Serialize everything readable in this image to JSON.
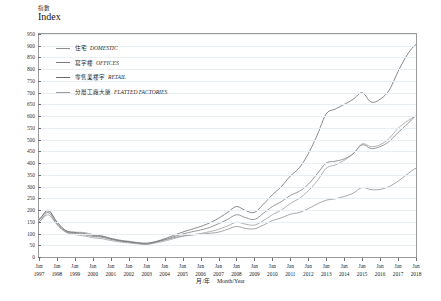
{
  "axes": {
    "y_title_cn": "指數",
    "y_title_en": "Index",
    "x_label_cn": "月/年",
    "x_label_en": "Month/Year",
    "y_ticks": [
      0,
      50,
      100,
      150,
      200,
      250,
      300,
      350,
      400,
      450,
      500,
      550,
      600,
      650,
      700,
      750,
      800,
      850,
      900,
      950
    ],
    "x_tick_month": "Jan",
    "x_tick_years": [
      1997,
      1998,
      1999,
      2000,
      2001,
      2002,
      2003,
      2004,
      2005,
      2006,
      2007,
      2008,
      2009,
      2010,
      2011,
      2012,
      2013,
      2014,
      2015,
      2016,
      2017,
      2018
    ]
  },
  "legend": [
    {
      "cn": "住宅",
      "en": "DOMESTIC",
      "color": "#8d8d8d"
    },
    {
      "cn": "寫字樓",
      "en": "OFFICES",
      "color": "#7a7a7a"
    },
    {
      "cn": "零售業樓宇",
      "en": "RETAIL",
      "color": "#6a6a6a"
    },
    {
      "cn": "分層工廠大廈",
      "en": "FLATTED FACTORIES",
      "color": "#9b9b9b"
    }
  ],
  "chart_data": {
    "type": "line",
    "title": "",
    "xlabel": "月/年 Month/Year",
    "ylabel": "指數 Index",
    "ylim": [
      0,
      950
    ],
    "xlim": [
      1997,
      2018
    ],
    "grid": true,
    "legend_position": "upper-left",
    "x": [
      1997,
      1997.5,
      1998,
      1998.5,
      1999,
      1999.5,
      2000,
      2000.5,
      2001,
      2001.5,
      2002,
      2002.5,
      2003,
      2003.5,
      2004,
      2004.5,
      2005,
      2005.5,
      2006,
      2006.5,
      2007,
      2007.5,
      2008,
      2008.5,
      2009,
      2009.5,
      2010,
      2010.5,
      2011,
      2011.5,
      2012,
      2012.5,
      2013,
      2013.5,
      2014,
      2014.5,
      2015,
      2015.5,
      2016,
      2016.5,
      2017,
      2017.5,
      2018
    ],
    "series": [
      {
        "name": "住宅 DOMESTIC",
        "values": [
          163,
          196,
          150,
          112,
          106,
          104,
          96,
          90,
          80,
          72,
          67,
          62,
          59,
          65,
          73,
          82,
          90,
          94,
          97,
          101,
          106,
          118,
          130,
          122,
          120,
          136,
          155,
          167,
          182,
          190,
          206,
          226,
          242,
          248,
          258,
          272,
          296,
          287,
          288,
          300,
          323,
          352,
          378
        ]
      },
      {
        "name": "寫字樓 OFFICES",
        "values": [
          150,
          190,
          140,
          108,
          100,
          95,
          88,
          84,
          75,
          68,
          63,
          58,
          55,
          63,
          74,
          86,
          98,
          107,
          115,
          126,
          142,
          160,
          180,
          168,
          160,
          186,
          215,
          236,
          262,
          280,
          310,
          355,
          400,
          408,
          418,
          440,
          478,
          462,
          470,
          492,
          530,
          565,
          600
        ]
      },
      {
        "name": "零售業樓宇 RETAIL",
        "values": [
          158,
          200,
          148,
          112,
          104,
          100,
          92,
          88,
          78,
          70,
          65,
          60,
          58,
          66,
          78,
          92,
          106,
          118,
          130,
          145,
          165,
          190,
          215,
          198,
          190,
          225,
          265,
          300,
          345,
          380,
          440,
          520,
          610,
          630,
          650,
          672,
          700,
          660,
          672,
          710,
          790,
          860,
          905
        ]
      },
      {
        "name": "分層工廠大廈 FLATTED FACTORIES",
        "values": [
          150,
          180,
          138,
          105,
          96,
          90,
          82,
          78,
          70,
          64,
          60,
          56,
          54,
          60,
          68,
          78,
          88,
          94,
          100,
          108,
          118,
          132,
          148,
          140,
          136,
          155,
          180,
          200,
          228,
          250,
          282,
          325,
          378,
          392,
          412,
          440,
          482,
          470,
          478,
          505,
          548,
          578,
          600
        ]
      }
    ]
  }
}
